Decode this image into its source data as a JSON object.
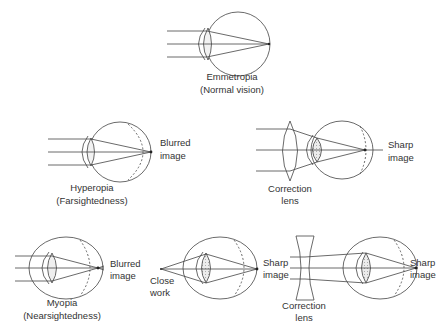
{
  "diagrams": {
    "emmetropia": {
      "title": "Emmetropia",
      "subtitle": "(Normal vision)"
    },
    "hyperopia": {
      "title": "Hyperopia",
      "subtitle": "(Farsightedness)",
      "image_label_1": "Blurred",
      "image_label_2": "image"
    },
    "hyperopia_corrected": {
      "lens_label_1": "Correction",
      "lens_label_2": "lens",
      "image_label_1": "Sharp",
      "image_label_2": "image"
    },
    "myopia": {
      "title": "Myopia",
      "subtitle": "(Nearsightedness)",
      "image_label_1": "Blurred",
      "image_label_2": "image"
    },
    "myopia_close_work": {
      "source_label_1": "Close",
      "source_label_2": "work",
      "image_label_1": "Sharp",
      "image_label_2": "image"
    },
    "myopia_corrected": {
      "lens_label_1": "Correction",
      "lens_label_2": "lens",
      "image_label_1": "Sharp",
      "image_label_2": "image"
    }
  },
  "colors": {
    "line": "#444444",
    "text": "#333333",
    "lens_fill": "#e6e6e6",
    "background": "#ffffff"
  }
}
